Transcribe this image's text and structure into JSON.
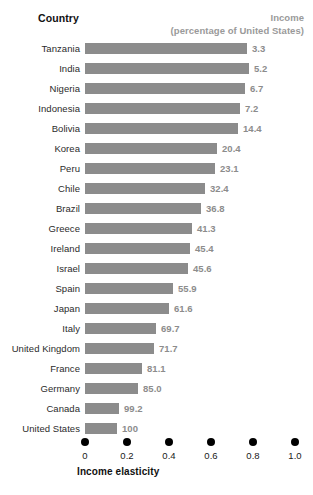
{
  "header": {
    "country_label": "Country",
    "income_label_line1": "Income",
    "income_label_line2": "(percentage of United States)"
  },
  "axis": {
    "title": "Income elasticity",
    "ticks": [
      "0",
      "0.2",
      "0.4",
      "0.6",
      "0.8",
      "1.0"
    ]
  },
  "colors": {
    "bar": "#8c8c8c",
    "value_text": "#8c8c8c",
    "header_income": "#9a9a9a",
    "label_text": "#2b2b2b",
    "dot": "#000000",
    "background": "#ffffff"
  },
  "chart_data": {
    "type": "bar",
    "orientation": "horizontal",
    "title": "",
    "xlabel": "Income elasticity",
    "ylabel": "Country",
    "xlim": [
      0,
      1.0
    ],
    "xticks": [
      0,
      0.2,
      0.4,
      0.6,
      0.8,
      1.0
    ],
    "grid": false,
    "legend": false,
    "categories": [
      "Tanzania",
      "India",
      "Nigeria",
      "Indonesia",
      "Bolivia",
      "Korea",
      "Peru",
      "Chile",
      "Brazil",
      "Greece",
      "Ireland",
      "Israel",
      "Spain",
      "Japan",
      "Italy",
      "United Kingdom",
      "France",
      "Germany",
      "Canada",
      "United States"
    ],
    "series": [
      {
        "name": "Income elasticity",
        "values": [
          0.77,
          0.78,
          0.76,
          0.74,
          0.73,
          0.63,
          0.62,
          0.57,
          0.55,
          0.51,
          0.5,
          0.49,
          0.42,
          0.4,
          0.34,
          0.33,
          0.27,
          0.25,
          0.16,
          0.15
        ]
      }
    ],
    "annotations": {
      "label": "Income (percentage of United States)",
      "values": [
        "3.3",
        "5.2",
        "6.7",
        "7.2",
        "14.4",
        "20.4",
        "23.1",
        "32.4",
        "36.8",
        "41.3",
        "45.4",
        "45.6",
        "55.9",
        "61.6",
        "69.7",
        "71.7",
        "81.1",
        "85.0",
        "99.2",
        "100"
      ]
    }
  },
  "rows": [
    {
      "country": "Tanzania",
      "income": "3.3",
      "elasticity": 0.77
    },
    {
      "country": "India",
      "income": "5.2",
      "elasticity": 0.78
    },
    {
      "country": "Nigeria",
      "income": "6.7",
      "elasticity": 0.76
    },
    {
      "country": "Indonesia",
      "income": "7.2",
      "elasticity": 0.74
    },
    {
      "country": "Bolivia",
      "income": "14.4",
      "elasticity": 0.73
    },
    {
      "country": "Korea",
      "income": "20.4",
      "elasticity": 0.63
    },
    {
      "country": "Peru",
      "income": "23.1",
      "elasticity": 0.62
    },
    {
      "country": "Chile",
      "income": "32.4",
      "elasticity": 0.57
    },
    {
      "country": "Brazil",
      "income": "36.8",
      "elasticity": 0.55
    },
    {
      "country": "Greece",
      "income": "41.3",
      "elasticity": 0.51
    },
    {
      "country": "Ireland",
      "income": "45.4",
      "elasticity": 0.5
    },
    {
      "country": "Israel",
      "income": "45.6",
      "elasticity": 0.49
    },
    {
      "country": "Spain",
      "income": "55.9",
      "elasticity": 0.42
    },
    {
      "country": "Japan",
      "income": "61.6",
      "elasticity": 0.4
    },
    {
      "country": "Italy",
      "income": "69.7",
      "elasticity": 0.34
    },
    {
      "country": "United Kingdom",
      "income": "71.7",
      "elasticity": 0.33
    },
    {
      "country": "France",
      "income": "81.1",
      "elasticity": 0.27
    },
    {
      "country": "Germany",
      "income": "85.0",
      "elasticity": 0.25
    },
    {
      "country": "Canada",
      "income": "99.2",
      "elasticity": 0.16
    },
    {
      "country": "United States",
      "income": "100",
      "elasticity": 0.15
    }
  ]
}
